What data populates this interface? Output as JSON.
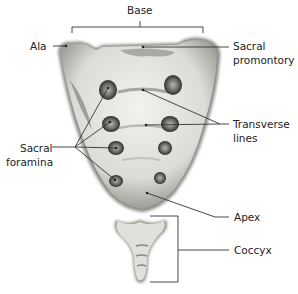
{
  "diagram": {
    "labels": {
      "base": "Base",
      "ala": "Ala",
      "sacral_promontory_1": "Sacral",
      "sacral_promontory_2": "promontory",
      "sacral_foramina_1": "Sacral",
      "sacral_foramina_2": "foramina",
      "transverse_lines_1": "Transverse",
      "transverse_lines_2": "lines",
      "apex": "Apex",
      "coccyx": "Coccyx"
    },
    "colors": {
      "bone_light": "#ecebe6",
      "bone_mid": "#c9c7c0",
      "bone_dark": "#555350",
      "leader_line": "#333333",
      "text": "#222222"
    }
  }
}
